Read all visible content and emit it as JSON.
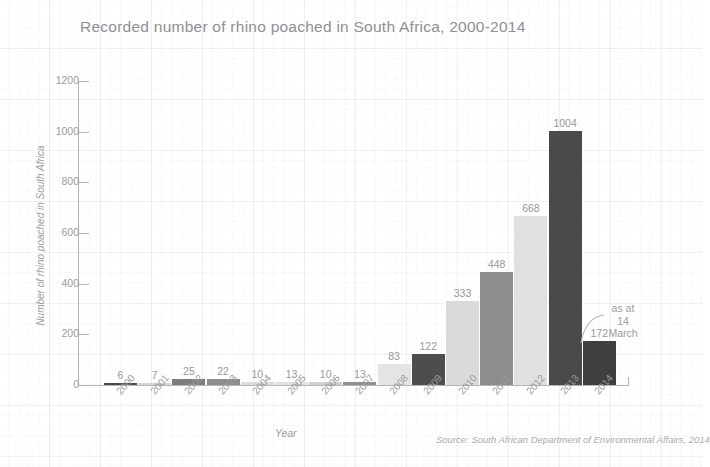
{
  "chart_data": {
    "type": "bar",
    "title": "Recorded number of rhino poached in South Africa, 2000-2014",
    "xlabel": "Year",
    "ylabel": "Number of rhino poached in South Africa",
    "ylim": [
      0,
      1200
    ],
    "yticks": [
      0,
      200,
      400,
      600,
      800,
      1000,
      1200
    ],
    "grid": true,
    "legend": "none",
    "categories": [
      "2000",
      "2001",
      "2002",
      "2003",
      "2004",
      "2005",
      "2006",
      "2007",
      "2008",
      "2009",
      "2010",
      "2011",
      "2012",
      "2013",
      "2014"
    ],
    "values": [
      6,
      7,
      25,
      22,
      10,
      13,
      10,
      13,
      83,
      122,
      333,
      448,
      668,
      1004,
      172
    ],
    "bar_colors": [
      "#4a4a4a",
      "#d5d5d5",
      "#7d7d7d",
      "#8d8d8d",
      "#dcdcdc",
      "#e2e2e2",
      "#cfcfcf",
      "#8f8f8f",
      "#e4e4e4",
      "#4d4d4d",
      "#dadada",
      "#8d8d8d",
      "#e0e0e0",
      "#4a4a4a",
      "#3f3f3f"
    ],
    "annotations": [
      {
        "text": "as at\n14\nMarch",
        "target_category": "2014"
      }
    ],
    "source": "Source: South African Department of Environmental Affairs, 2014"
  },
  "annotation": {
    "line1": "as at",
    "line2": "14",
    "line3": "March"
  },
  "colors": {
    "text": "#9a9c9e",
    "title": "#8e9093",
    "axis": "#b4b6b8",
    "grid": "#eef1f4",
    "background": "#ffffff"
  }
}
